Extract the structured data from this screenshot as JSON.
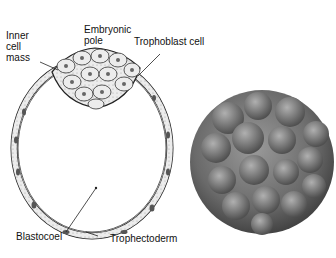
{
  "diagram": {
    "labels": {
      "inner_cell_mass": "Inner\ncell\nmass",
      "embryonic_pole": "Embryonic\npole",
      "trophoblast_cell": "Trophoblast cell",
      "blastocoel": "Blastocoel",
      "trophectoderm": "Trophectoderm"
    },
    "right_image": "blastocyst-micrograph",
    "colors": {
      "line": "#222222",
      "cell_fill": "#e6e6e6",
      "micrograph": "#6e6e6e"
    }
  }
}
